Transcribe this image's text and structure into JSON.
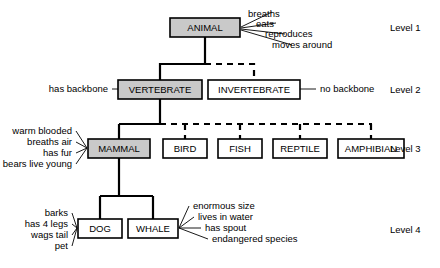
{
  "diagram": {
    "levels": [
      {
        "id": "level-1",
        "label": "Level 1",
        "x": 390,
        "y": 28
      },
      {
        "id": "level-2",
        "label": "Level 2",
        "x": 390,
        "y": 90
      },
      {
        "id": "level-3",
        "label": "Level 3",
        "x": 390,
        "y": 149
      },
      {
        "id": "level-4",
        "label": "Level 4",
        "x": 390,
        "y": 230
      }
    ],
    "nodes": [
      {
        "id": "animal",
        "label": "ANIMAL",
        "x": 170,
        "y": 18,
        "w": 70,
        "h": 19,
        "shaded": true
      },
      {
        "id": "vertebrate",
        "label": "VERTEBRATE",
        "x": 118,
        "y": 80,
        "w": 84,
        "h": 19,
        "shaded": true
      },
      {
        "id": "invertebrate",
        "label": "INVERTEBRATE",
        "x": 208,
        "y": 80,
        "w": 92,
        "h": 19,
        "shaded": false
      },
      {
        "id": "mammal",
        "label": "MAMMAL",
        "x": 88,
        "y": 139,
        "w": 62,
        "h": 19,
        "shaded": true
      },
      {
        "id": "bird",
        "label": "BIRD",
        "x": 163,
        "y": 139,
        "w": 44,
        "h": 19,
        "shaded": false
      },
      {
        "id": "fish",
        "label": "FISH",
        "x": 218,
        "y": 139,
        "w": 44,
        "h": 19,
        "shaded": false
      },
      {
        "id": "reptile",
        "label": "REPTILE",
        "x": 273,
        "y": 139,
        "w": 54,
        "h": 19,
        "shaded": false
      },
      {
        "id": "amphibian",
        "label": "AMPHIBIAN",
        "x": 338,
        "y": 139,
        "w": 66,
        "h": 19,
        "shaded": false
      },
      {
        "id": "dog",
        "label": "DOG",
        "x": 78,
        "y": 219,
        "w": 44,
        "h": 19,
        "shaded": false
      },
      {
        "id": "whale",
        "label": "WHALE",
        "x": 128,
        "y": 219,
        "w": 50,
        "h": 19,
        "shaded": false
      }
    ],
    "attributes": [
      {
        "id": "animal-attrs",
        "node": "animal",
        "side": "right",
        "items": [
          {
            "text": "breaths",
            "x": 248,
            "y": 14
          },
          {
            "text": "eats",
            "x": 256,
            "y": 24
          },
          {
            "text": "reproduces",
            "x": 265,
            "y": 34
          },
          {
            "text": "moves around",
            "x": 272,
            "y": 45
          }
        ]
      },
      {
        "id": "vertebrate-attrs",
        "node": "vertebrate",
        "side": "left",
        "items": [
          {
            "text": "has backbone",
            "x": 108,
            "y": 89
          }
        ]
      },
      {
        "id": "invertebrate-attrs",
        "node": "invertebrate",
        "side": "right",
        "items": [
          {
            "text": "no backbone",
            "x": 312,
            "y": 89
          }
        ]
      },
      {
        "id": "mammal-attrs",
        "node": "mammal",
        "side": "left",
        "items": [
          {
            "text": "warm blooded",
            "x": 72,
            "y": 131
          },
          {
            "text": "breaths air",
            "x": 72,
            "y": 142
          },
          {
            "text": "has fur",
            "x": 72,
            "y": 153
          },
          {
            "text": "bears live young",
            "x": 72,
            "y": 164
          }
        ]
      },
      {
        "id": "dog-attrs",
        "node": "dog",
        "side": "left",
        "items": [
          {
            "text": "barks",
            "x": 68,
            "y": 213
          },
          {
            "text": "has 4 legs",
            "x": 68,
            "y": 224
          },
          {
            "text": "wags tail",
            "x": 68,
            "y": 235
          },
          {
            "text": "pet",
            "x": 68,
            "y": 246
          }
        ]
      },
      {
        "id": "whale-attrs",
        "node": "whale",
        "side": "right",
        "items": [
          {
            "text": "enormous size",
            "x": 193,
            "y": 206
          },
          {
            "text": "lives in water",
            "x": 198,
            "y": 217
          },
          {
            "text": "has spout",
            "x": 205,
            "y": 228
          },
          {
            "text": "endangered species",
            "x": 212,
            "y": 239
          }
        ]
      }
    ],
    "connector_style": {
      "solid": "solid",
      "dashed": "dashed"
    }
  }
}
